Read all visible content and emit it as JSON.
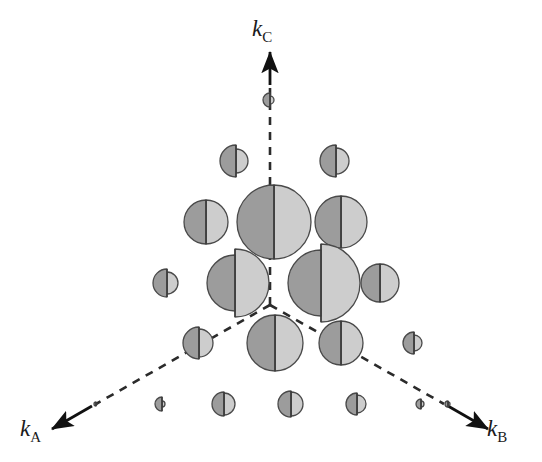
{
  "figure": {
    "type": "reciprocal-space-lattice-diagram",
    "background_color": "#ffffff",
    "width": 542,
    "height": 462,
    "origin": {
      "x": 270,
      "y": 305
    },
    "title": "",
    "caption": ""
  },
  "axes": {
    "line_style": "dashed",
    "line_color": "#2b2b2b",
    "arrow_color": "#111111",
    "items": [
      {
        "id": "kc",
        "label_letter": "k",
        "label_subscript": "C",
        "direction": "up",
        "dash_start": {
          "x": 270,
          "y": 305
        },
        "dash_end": {
          "x": 270,
          "y": 88
        },
        "arrow_tail": {
          "x": 270,
          "y": 85
        },
        "arrow_head": {
          "x": 270,
          "y": 52
        },
        "label_position": {
          "x": 252,
          "y": 17
        }
      },
      {
        "id": "ka",
        "label_letter": "k",
        "label_subscript": "A",
        "direction": "down-left",
        "dash_start": {
          "x": 270,
          "y": 305
        },
        "dash_end": {
          "x": 96,
          "y": 404
        },
        "arrow_tail": {
          "x": 92,
          "y": 406
        },
        "arrow_head": {
          "x": 52,
          "y": 429
        },
        "label_position": {
          "x": 20,
          "y": 417
        }
      },
      {
        "id": "kb",
        "label_letter": "k",
        "label_subscript": "B",
        "direction": "down-right",
        "dash_start": {
          "x": 270,
          "y": 305
        },
        "dash_end": {
          "x": 444,
          "y": 404
        },
        "arrow_tail": {
          "x": 448,
          "y": 406
        },
        "arrow_head": {
          "x": 488,
          "y": 429
        },
        "label_position": {
          "x": 487,
          "y": 417
        }
      }
    ]
  },
  "colors": {
    "dark_half": "#9c9c9c",
    "light_half": "#cdcdcd",
    "outline": "#4a4a4a",
    "divider": "#3a3a3a",
    "text": "#1a1a1a",
    "axis": "#2b2b2b"
  },
  "chart_data": {
    "type": "scatter",
    "title": "",
    "xlabel": "k_A / k_B",
    "ylabel": "k_C",
    "legend": [],
    "grid": false,
    "note": "Each marker is a split disc: dark-grey left half of radius r_dark and light-grey right half of radius r_light, sharing a common vertical divider. Radii encode relative intensity.",
    "markers": [
      {
        "id": "m01",
        "cx": 268,
        "cy": 100,
        "r_dark": 7,
        "r_light": 4,
        "split_dx": 2,
        "row": "top"
      },
      {
        "id": "m02",
        "cx": 232,
        "cy": 161,
        "r_dark": 16,
        "r_light": 12,
        "split_dx": 4,
        "row": "upper"
      },
      {
        "id": "m03",
        "cx": 333,
        "cy": 161,
        "r_dark": 16,
        "r_light": 13,
        "split_dx": 3,
        "row": "upper"
      },
      {
        "id": "m04",
        "cx": 206,
        "cy": 222,
        "r_dark": 22,
        "r_light": 22,
        "split_dx": 0,
        "row": "mid-upper"
      },
      {
        "id": "m05",
        "cx": 272,
        "cy": 222,
        "r_dark": 37,
        "r_light": 37,
        "split_dx": 2,
        "row": "mid-upper"
      },
      {
        "id": "m06",
        "cx": 341,
        "cy": 222,
        "r_dark": 26,
        "r_light": 26,
        "split_dx": 0,
        "row": "mid-upper"
      },
      {
        "id": "m07",
        "cx": 164,
        "cy": 283,
        "r_dark": 14,
        "r_light": 11,
        "split_dx": 3,
        "row": "mid"
      },
      {
        "id": "m08",
        "cx": 226,
        "cy": 283,
        "r_dark": 28,
        "r_light": 34,
        "split_dx": 9,
        "row": "mid"
      },
      {
        "id": "m09",
        "cx": 311,
        "cy": 283,
        "r_dark": 33,
        "r_light": 39,
        "split_dx": 10,
        "row": "mid"
      },
      {
        "id": "m10",
        "cx": 380,
        "cy": 283,
        "r_dark": 19,
        "r_light": 19,
        "split_dx": 0,
        "row": "mid"
      },
      {
        "id": "m11",
        "cx": 196,
        "cy": 343,
        "r_dark": 16,
        "r_light": 14,
        "split_dx": 3,
        "row": "lower"
      },
      {
        "id": "m12",
        "cx": 272,
        "cy": 343,
        "r_dark": 28,
        "r_light": 28,
        "split_dx": 3,
        "row": "lower"
      },
      {
        "id": "m13",
        "cx": 340,
        "cy": 343,
        "r_dark": 22,
        "r_light": 22,
        "split_dx": 1,
        "row": "lower"
      },
      {
        "id": "m14",
        "cx": 411,
        "cy": 343,
        "r_dark": 11,
        "r_light": 8,
        "split_dx": 3,
        "row": "lower"
      },
      {
        "id": "m15",
        "cx": 160,
        "cy": 404,
        "r_dark": 7,
        "r_light": 3,
        "split_dx": 2,
        "row": "bottom"
      },
      {
        "id": "m16",
        "cx": 222,
        "cy": 404,
        "r_dark": 12,
        "r_light": 11,
        "split_dx": 2,
        "row": "bottom"
      },
      {
        "id": "m17",
        "cx": 290,
        "cy": 404,
        "r_dark": 13,
        "r_light": 12,
        "split_dx": 1,
        "row": "bottom"
      },
      {
        "id": "m18",
        "cx": 355,
        "cy": 404,
        "r_dark": 11,
        "r_light": 9,
        "split_dx": 2,
        "row": "bottom"
      },
      {
        "id": "m19",
        "cx": 419,
        "cy": 404,
        "r_dark": 5,
        "r_light": 3,
        "split_dx": 2,
        "row": "bottom"
      },
      {
        "id": "m20",
        "cx": 95,
        "cy": 404,
        "r_dark": 2,
        "r_light": 1,
        "split_dx": 1,
        "row": "bottom-edge"
      },
      {
        "id": "m21",
        "cx": 447,
        "cy": 404,
        "r_dark": 3,
        "r_light": 2,
        "split_dx": 1,
        "row": "bottom-edge"
      }
    ]
  }
}
